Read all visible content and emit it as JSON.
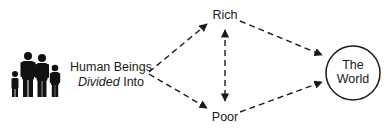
{
  "diagram": {
    "source_label": {
      "line1": "Human Beings",
      "line2_italic": "Divided",
      "line2_rest": " Into"
    },
    "nodes": {
      "rich": "Rich",
      "poor": "Poor",
      "world_line1": "The",
      "world_line2": "World"
    },
    "icons": {
      "people": "family-people-icon"
    },
    "edges": [
      {
        "from": "Human Beings Divided Into",
        "to": "Rich",
        "style": "dashed-arrow"
      },
      {
        "from": "Human Beings Divided Into",
        "to": "Poor",
        "style": "dashed-arrow"
      },
      {
        "from": "Rich",
        "to": "Poor",
        "style": "dashed-double-arrow"
      },
      {
        "from": "Rich",
        "to": "The World",
        "style": "dashed-arrow"
      },
      {
        "from": "Poor",
        "to": "The World",
        "style": "dashed-arrow"
      }
    ],
    "colors": {
      "ink": "#1a1a1a",
      "background": "#ffffff"
    }
  }
}
